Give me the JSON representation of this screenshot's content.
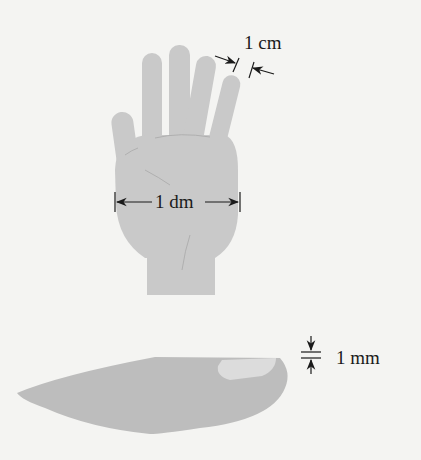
{
  "figure": {
    "colors": {
      "background": "#f4f4f2",
      "hand": "#c9c9c9",
      "nail_finger": "#bdbdbd",
      "nail_highlight": "#dcdcdc",
      "annotation": "#1a1a1a"
    },
    "annotations": [
      {
        "id": "finger-width",
        "label": "1 cm",
        "meaning": "width of a finger"
      },
      {
        "id": "hand-width",
        "label": "1 dm",
        "meaning": "width of a palm"
      },
      {
        "id": "nail-thickness",
        "label": "1 mm",
        "meaning": "thickness of a fingernail"
      }
    ]
  }
}
